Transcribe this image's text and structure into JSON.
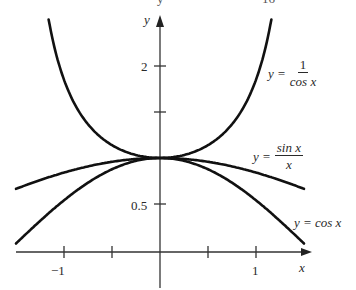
{
  "chart_data": {
    "type": "line",
    "title": "",
    "xlabel": "x",
    "ylabel": "y",
    "xlim": [
      -1.5,
      1.5
    ],
    "ylim": [
      0,
      2.5
    ],
    "grid": false,
    "x_ticks": [
      -1,
      -0.5,
      0.5,
      1
    ],
    "x_tick_labels": [
      "−1",
      "",
      "",
      "1"
    ],
    "y_ticks": [
      0.5,
      1,
      1.5,
      2
    ],
    "y_tick_labels": [
      "0.5",
      "",
      "",
      "2"
    ],
    "series": [
      {
        "name": "y = 1/cos x",
        "function": "1/cos(x)",
        "x": [
          -1.16,
          -1.0,
          -0.75,
          -0.5,
          -0.25,
          0,
          0.25,
          0.5,
          0.75,
          1.0,
          1.16
        ],
        "values": [
          2.5,
          1.85,
          1.37,
          1.14,
          1.03,
          1.0,
          1.03,
          1.14,
          1.37,
          1.85,
          2.5
        ]
      },
      {
        "name": "y = sin x / x",
        "function": "sin(x)/x",
        "x": [
          -1.5,
          -1.0,
          -0.5,
          0,
          0.5,
          1.0,
          1.5
        ],
        "values": [
          0.665,
          0.841,
          0.959,
          1.0,
          0.959,
          0.841,
          0.665
        ]
      },
      {
        "name": "y = cos x",
        "function": "cos(x)",
        "x": [
          -1.5,
          -1.0,
          -0.5,
          0,
          0.5,
          1.0,
          1.5
        ],
        "values": [
          0.071,
          0.54,
          0.878,
          1.0,
          0.878,
          0.54,
          0.071
        ]
      }
    ],
    "annotations": [
      {
        "text": "y = 1/cos x",
        "near": "right, upper"
      },
      {
        "text": "y = sin x / x",
        "near": "right, middle"
      },
      {
        "text": "y = cos x",
        "near": "right, lower"
      }
    ]
  },
  "labels": {
    "x_axis": "x",
    "y_axis": "y",
    "tick_x_neg1": "−1",
    "tick_x_1": "1",
    "tick_y_2": "2",
    "tick_y_05": "0.5",
    "secant": {
      "lhs": "y =",
      "num": "1",
      "den": "cos x"
    },
    "sinc": {
      "lhs": "y =",
      "num": "sin x",
      "den": "x"
    },
    "cosine": "y = cos x"
  },
  "cropped_top": {
    "left": "y",
    "right": "16"
  }
}
